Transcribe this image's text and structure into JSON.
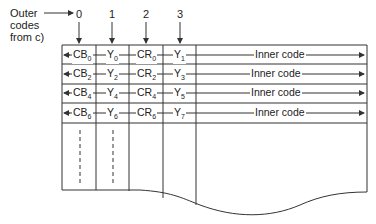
{
  "diagram": {
    "outer_label": [
      "Outer",
      "codes",
      "from c)"
    ],
    "column_indices": [
      "0",
      "1",
      "2",
      "3"
    ],
    "rows": [
      {
        "cells": [
          {
            "base": "CB",
            "sub": "0"
          },
          {
            "base": "Y",
            "sub": "0"
          },
          {
            "base": "CR",
            "sub": "0"
          },
          {
            "base": "Y",
            "sub": "1"
          }
        ],
        "inner": "Inner code"
      },
      {
        "cells": [
          {
            "base": "CB",
            "sub": "2"
          },
          {
            "base": "Y",
            "sub": "2"
          },
          {
            "base": "CR",
            "sub": "2"
          },
          {
            "base": "Y",
            "sub": "3"
          }
        ],
        "inner": "Inner code"
      },
      {
        "cells": [
          {
            "base": "CB",
            "sub": "4"
          },
          {
            "base": "Y",
            "sub": "4"
          },
          {
            "base": "CR",
            "sub": "4"
          },
          {
            "base": "Y",
            "sub": "5"
          }
        ],
        "inner": "Inner code"
      },
      {
        "cells": [
          {
            "base": "CB",
            "sub": "6"
          },
          {
            "base": "Y",
            "sub": "6"
          },
          {
            "base": "CR",
            "sub": "6"
          },
          {
            "base": "Y",
            "sub": "7"
          }
        ],
        "inner": "Inner code"
      }
    ],
    "line_color": "#333333"
  }
}
